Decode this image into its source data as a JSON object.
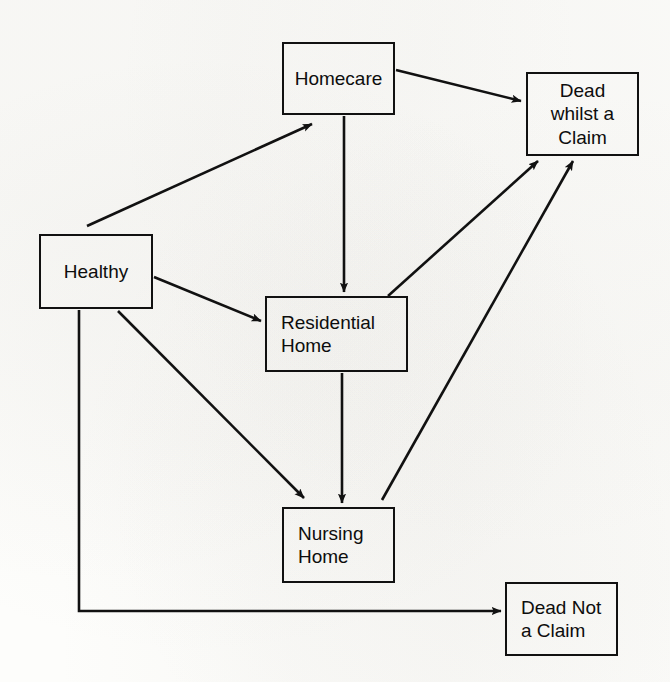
{
  "diagram": {
    "type": "state-transition-diagram",
    "line_color": "#111111",
    "background_color": "#fdfdfb",
    "nodes": [
      {
        "id": "homecare",
        "label": "Homecare",
        "x": 282,
        "y": 42,
        "w": 113,
        "h": 73,
        "align": "center"
      },
      {
        "id": "dead-whilst-claim",
        "label": "Dead\nwhilst a\nClaim",
        "x": 526,
        "y": 72,
        "w": 113,
        "h": 84,
        "align": "center"
      },
      {
        "id": "healthy",
        "label": "Healthy",
        "x": 39,
        "y": 234,
        "w": 114,
        "h": 75,
        "align": "center"
      },
      {
        "id": "residential-home",
        "label": "Residential\nHome",
        "x": 265,
        "y": 296,
        "w": 143,
        "h": 76,
        "align": "left"
      },
      {
        "id": "nursing-home",
        "label": "Nursing\nHome",
        "x": 282,
        "y": 507,
        "w": 113,
        "h": 76,
        "align": "left"
      },
      {
        "id": "dead-not-claim",
        "label": "Dead Not\na Claim",
        "x": 505,
        "y": 582,
        "w": 113,
        "h": 74,
        "align": "left"
      }
    ],
    "edges": [
      {
        "id": "healthy-to-homecare",
        "from": "healthy",
        "to": "homecare",
        "shape": "diagonal"
      },
      {
        "id": "healthy-to-residential",
        "from": "healthy",
        "to": "residential-home",
        "shape": "diagonal"
      },
      {
        "id": "healthy-to-nursing",
        "from": "healthy",
        "to": "nursing-home",
        "shape": "diagonal"
      },
      {
        "id": "healthy-to-dead-not-claim",
        "from": "healthy",
        "to": "dead-not-claim",
        "shape": "elbow"
      },
      {
        "id": "homecare-to-dead-whilst",
        "from": "homecare",
        "to": "dead-whilst-claim",
        "shape": "diagonal"
      },
      {
        "id": "homecare-to-residential",
        "from": "homecare",
        "to": "residential-home",
        "shape": "vertical"
      },
      {
        "id": "residential-to-dead-whilst",
        "from": "residential-home",
        "to": "dead-whilst-claim",
        "shape": "diagonal"
      },
      {
        "id": "residential-to-nursing",
        "from": "residential-home",
        "to": "nursing-home",
        "shape": "vertical"
      },
      {
        "id": "nursing-to-dead-whilst",
        "from": "nursing-home",
        "to": "dead-whilst-claim",
        "shape": "diagonal"
      }
    ]
  }
}
